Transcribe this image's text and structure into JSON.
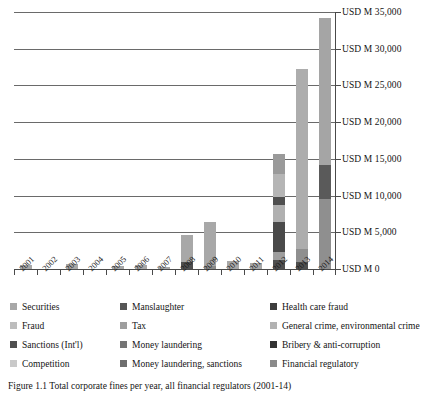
{
  "chart_data": {
    "type": "bar",
    "subtype": "stacked-bar",
    "title": "",
    "xlabel": "",
    "ylabel": "",
    "ylim": [
      0,
      35000
    ],
    "grid": true,
    "legend_position": "bottom",
    "categories": [
      "2001",
      "2002",
      "2003",
      "2004",
      "2005",
      "2006",
      "2007",
      "2008",
      "2009",
      "2010",
      "2011",
      "2012",
      "2013",
      "2014"
    ],
    "ytick_labels": [
      "USD M 0",
      "USD M 5,000",
      "USD M 10,000",
      "USD M 15,000",
      "USD M 20,000",
      "USD M 25,000",
      "USD M 30,000",
      "USD M 35,000"
    ],
    "ytick_values": [
      0,
      5000,
      10000,
      15000,
      20000,
      25000,
      30000,
      35000
    ],
    "series": [
      {
        "name": "Securities",
        "color": "#a8a8a8",
        "values": [
          550,
          0,
          620,
          0,
          380,
          530,
          330,
          2950,
          5600,
          1050,
          800,
          1100,
          1750,
          0
        ]
      },
      {
        "name": "Fraud",
        "color": "#bdbdbd",
        "values": [
          0,
          0,
          0,
          0,
          0,
          0,
          0,
          0,
          0,
          0,
          0,
          2600,
          0,
          0
        ]
      },
      {
        "name": "Sanctions (Int'l)",
        "color": "#4f4f4f",
        "values": [
          0,
          0,
          0,
          0,
          0,
          0,
          0,
          850,
          450,
          0,
          0,
          3100,
          950,
          4400
        ]
      },
      {
        "name": "Competition",
        "color": "#c9c9c9",
        "values": [
          0,
          0,
          0,
          0,
          0,
          0,
          0,
          0,
          0,
          0,
          0,
          1600,
          0,
          0
        ]
      },
      {
        "name": "Manslaughter",
        "color": "#565656",
        "values": [
          0,
          0,
          0,
          0,
          0,
          0,
          0,
          0,
          0,
          0,
          0,
          0,
          0,
          0
        ]
      },
      {
        "name": "Tax",
        "color": "#9e9e9e",
        "values": [
          0,
          0,
          0,
          0,
          0,
          0,
          0,
          0,
          0,
          0,
          0,
          0,
          0,
          0
        ]
      },
      {
        "name": "Money laundering",
        "color": "#757575",
        "values": [
          0,
          0,
          0,
          0,
          0,
          0,
          0,
          900,
          0,
          0,
          0,
          1600,
          0,
          0
        ]
      },
      {
        "name": "Money laundering, sanctions",
        "color": "#6e6e6e",
        "values": [
          0,
          0,
          0,
          0,
          0,
          0,
          0,
          0,
          0,
          0,
          0,
          1400,
          0,
          0
        ]
      },
      {
        "name": "Health care fraud",
        "color": "#3d3d3d",
        "values": [
          0,
          0,
          0,
          0,
          0,
          0,
          0,
          0,
          0,
          0,
          0,
          0,
          0,
          0
        ]
      },
      {
        "name": "General crime, environmental crime",
        "color": "#b2b2b2",
        "values": [
          0,
          0,
          0,
          0,
          0,
          0,
          0,
          0,
          350,
          0,
          0,
          0,
          0,
          0
        ]
      },
      {
        "name": "Bribery & anti-corruption",
        "color": "#333333",
        "values": [
          0,
          0,
          0,
          0,
          0,
          0,
          0,
          0,
          0,
          0,
          0,
          0,
          0,
          0
        ]
      },
      {
        "name": "Financial regulatory",
        "color": "#8a8a8a",
        "values": [
          0,
          0,
          0,
          0,
          0,
          0,
          0,
          0,
          0,
          0,
          0,
          4300,
          24600,
          29800
        ]
      }
    ],
    "bar_totals": [
      550,
      0,
      620,
      0,
      380,
      530,
      330,
      4700,
      6400,
      1050,
      800,
      15700,
      27300,
      34200
    ],
    "stacks": [
      {
        "year": "2001",
        "segments": [
          {
            "color": "#a8a8a8",
            "value": 550
          }
        ]
      },
      {
        "year": "2002",
        "segments": []
      },
      {
        "year": "2003",
        "segments": [
          {
            "color": "#a8a8a8",
            "value": 620
          }
        ]
      },
      {
        "year": "2004",
        "segments": []
      },
      {
        "year": "2005",
        "segments": [
          {
            "color": "#a8a8a8",
            "value": 380
          }
        ]
      },
      {
        "year": "2006",
        "segments": [
          {
            "color": "#a8a8a8",
            "value": 530
          }
        ]
      },
      {
        "year": "2007",
        "segments": [
          {
            "color": "#a8a8a8",
            "value": 330
          }
        ]
      },
      {
        "year": "2008",
        "segments": [
          {
            "color": "#4f4f4f",
            "value": 900
          },
          {
            "color": "#a8a8a8",
            "value": 3800
          }
        ]
      },
      {
        "year": "2009",
        "segments": [
          {
            "color": "#8a8a8a",
            "value": 450
          },
          {
            "color": "#a8a8a8",
            "value": 5950
          }
        ]
      },
      {
        "year": "2010",
        "segments": [
          {
            "color": "#a8a8a8",
            "value": 1050
          }
        ]
      },
      {
        "year": "2011",
        "segments": [
          {
            "color": "#a8a8a8",
            "value": 800
          }
        ]
      },
      {
        "year": "2012",
        "segments": [
          {
            "color": "#4f4f4f",
            "value": 1250
          },
          {
            "color": "#9e9e9e",
            "value": 1050
          },
          {
            "color": "#4a4a4a",
            "value": 4100
          },
          {
            "color": "#b0b0b0",
            "value": 2300
          },
          {
            "color": "#4f4f4f",
            "value": 1150
          },
          {
            "color": "#b5b5b5",
            "value": 3050
          },
          {
            "color": "#9a9a9a",
            "value": 2800
          }
        ]
      },
      {
        "year": "2013",
        "segments": [
          {
            "color": "#4f4f4f",
            "value": 900
          },
          {
            "color": "#8f8f8f",
            "value": 1800
          },
          {
            "color": "#adadad",
            "value": 24600
          }
        ]
      },
      {
        "year": "2014",
        "segments": [
          {
            "color": "#8f8f8f",
            "value": 9600
          },
          {
            "color": "#5a5a5a",
            "value": 4600
          },
          {
            "color": "#a5a5a5",
            "value": 20000
          }
        ]
      }
    ]
  },
  "legend": {
    "items": [
      {
        "label": "Securities",
        "color": "#a8a8a8"
      },
      {
        "label": "Manslaughter",
        "color": "#565656"
      },
      {
        "label": "Health care fraud",
        "color": "#3d3d3d"
      },
      {
        "label": "Fraud",
        "color": "#bdbdbd"
      },
      {
        "label": "Tax",
        "color": "#9e9e9e"
      },
      {
        "label": "General crime, environmental crime",
        "color": "#b2b2b2"
      },
      {
        "label": "Sanctions (Int'l)",
        "color": "#4f4f4f"
      },
      {
        "label": "Money laundering",
        "color": "#757575"
      },
      {
        "label": "Bribery & anti-corruption",
        "color": "#333333"
      },
      {
        "label": "Competition",
        "color": "#c9c9c9"
      },
      {
        "label": "Money laundering, sanctions",
        "color": "#6e6e6e"
      },
      {
        "label": "Financial regulatory",
        "color": "#8a8a8a"
      }
    ]
  },
  "caption": {
    "text": "Figure 1.1  Total corporate fines per year, all financial regulators (2001-14)"
  }
}
